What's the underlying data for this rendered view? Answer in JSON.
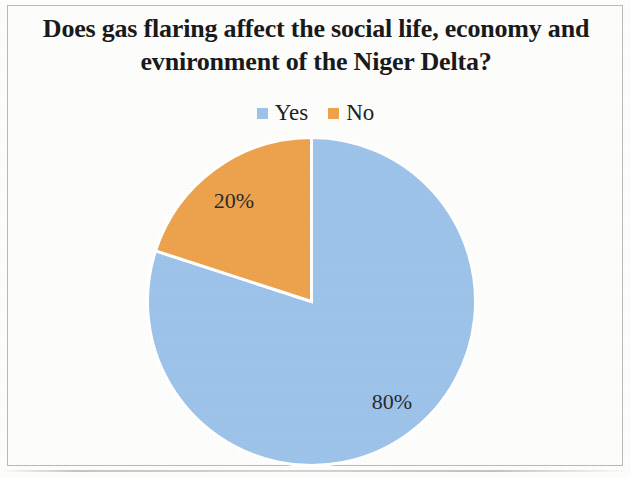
{
  "chart_data": {
    "type": "pie",
    "title": "Does gas flaring affect the social life, economy and evnironment of the Niger Delta?",
    "title_lines": [
      "Does gas flaring affect the social life, economy and",
      "evnironment of the Niger Delta?"
    ],
    "categories": [
      "Yes",
      "No"
    ],
    "values": [
      80,
      20
    ],
    "data_labels": [
      "80%",
      "20%"
    ],
    "colors": [
      "#9DC3EA",
      "#EDA24D"
    ],
    "legend_position": "top",
    "legend": [
      {
        "label": "Yes",
        "color": "#9DC3EA",
        "value": 80,
        "data_label": "80%"
      },
      {
        "label": "No",
        "color": "#EDA24D",
        "value": 20,
        "data_label": "20%"
      }
    ],
    "start_angle_deg": 0,
    "direction": "clockwise",
    "units": "percent",
    "grid": false,
    "xlabel": "",
    "ylabel": ""
  },
  "figure": {
    "border_color": "#b9b9b9",
    "background_color": "#fdfdfc",
    "title_color": "#1a1a1a",
    "label_color": "#2b2b2b"
  }
}
